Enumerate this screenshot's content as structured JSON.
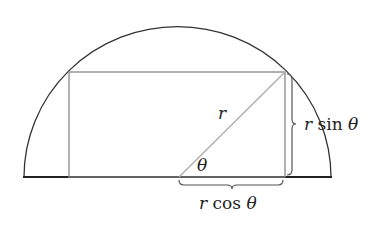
{
  "diagram": {
    "type": "semicircle-inscribed-rectangle",
    "labels": {
      "radius": "r",
      "angle": "θ",
      "height_r": "r",
      "height_fn": " sin ",
      "height_theta": "θ",
      "width_r": "r",
      "width_fn": " cos ",
      "width_theta": "θ"
    },
    "colors": {
      "arc": "#333333",
      "baseline": "#222222",
      "rectangle": "#888888",
      "radius_line": "#aaaaaa",
      "brace": "#555555"
    }
  }
}
